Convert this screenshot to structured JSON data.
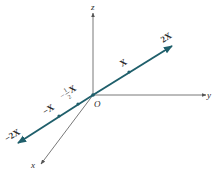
{
  "diagram": {
    "axes": {
      "z_label": "z",
      "y_label": "y",
      "x_label": "x",
      "origin_label": "O"
    },
    "vector_line": {
      "color": "#1f5f6b",
      "labels": {
        "pos2": "2X",
        "pos1": "X",
        "neg_half_num": "1",
        "neg_half_den": "2",
        "neg_half_sign": "−",
        "neg_half_var": "X",
        "neg1": "−X",
        "neg2": "−2X"
      }
    },
    "axis_color": "#555555"
  }
}
